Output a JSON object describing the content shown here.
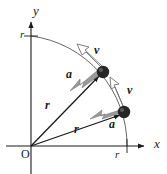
{
  "figure": {
    "background": "#ffffff",
    "width": 167,
    "height": 174
  },
  "axes": {
    "x_label": "x",
    "y_label": "y",
    "origin_label": "O",
    "x_tick_label": "r",
    "y_tick_label": "r",
    "axis_color": "#1a1a1a",
    "origin": {
      "x": 31,
      "y": 146
    },
    "x_axis_end": {
      "x": 150,
      "y": 146
    },
    "y_axis_end": {
      "x": 31,
      "y": 18
    },
    "x_tick_at": {
      "x": 127,
      "y": 146
    },
    "y_tick_at": {
      "x": 31,
      "y": 36
    }
  },
  "arc": {
    "name": "circular-path",
    "radius": 110,
    "color": "#555555",
    "start": {
      "x": 31,
      "y": 36
    },
    "end": {
      "x": 127,
      "y": 146
    }
  },
  "particles": [
    {
      "id": "upper",
      "position": {
        "x": 103,
        "y": 72
      },
      "radius_label": "r",
      "radius_label_pos": {
        "x": 45,
        "y": 105
      },
      "velocity_label": "v",
      "velocity_label_pos": {
        "x": 94,
        "y": 50
      },
      "acceleration_label": "a",
      "acceleration_label_pos": {
        "x": 66,
        "y": 74
      },
      "dot_color": "#262626",
      "velocity_arrow_style": "outline",
      "acceleration_arrow_style": "filled-gray"
    },
    {
      "id": "lower",
      "position": {
        "x": 124,
        "y": 112
      },
      "radius_label": "r",
      "radius_label_pos": {
        "x": 74,
        "y": 129
      },
      "velocity_label": "v",
      "velocity_label_pos": {
        "x": 127,
        "y": 90
      },
      "acceleration_label": "a",
      "acceleration_label_pos": {
        "x": 109,
        "y": 124
      },
      "dot_color": "#262626",
      "velocity_arrow_style": "outline",
      "acceleration_arrow_style": "filled-gray"
    }
  ],
  "colors": {
    "ink": "#1a1a1a",
    "arc": "#555555",
    "vector_gray": "#9a9a9a",
    "vector_gray_edge": "#7a7a7a",
    "outline_arrow_fill": "#ffffff",
    "outline_arrow_edge": "#707070",
    "particle": "#262626"
  }
}
